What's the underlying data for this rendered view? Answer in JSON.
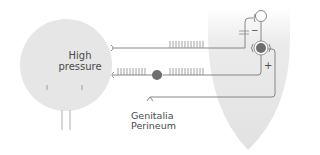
{
  "diagram": {
    "labels": {
      "high": "High",
      "pressure": "pressure",
      "genitalia": "Genitalia",
      "perineum": "Perineum",
      "minus": "−",
      "plus": "+"
    },
    "colors": {
      "bladder_fill": "#e6e6e6",
      "cord_fill": "#e8e8e8",
      "line": "#7a7a7a",
      "neuron_body": "#6e6e6e",
      "text": "#4a4a4a"
    }
  }
}
